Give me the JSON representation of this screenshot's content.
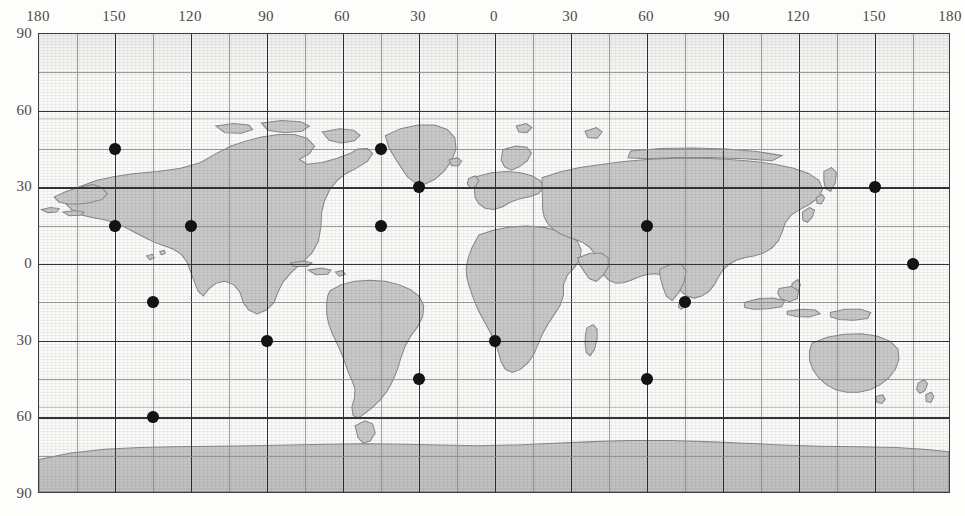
{
  "figure": {
    "kind": "world-map-scatter"
  },
  "axes": {
    "x_label": "",
    "y_label": "",
    "x_ticks": [
      "180",
      "150",
      "120",
      "90",
      "60",
      "30",
      "0",
      "30",
      "60",
      "90",
      "120",
      "150",
      "180"
    ],
    "y_ticks": [
      "90",
      "60",
      "30",
      "0",
      "30",
      "60",
      "90"
    ],
    "x_range": [
      -180,
      180
    ],
    "y_range": [
      -90,
      90
    ],
    "x_tick_step_deg": 30,
    "y_tick_step_deg": 30,
    "grid_step_deg": 15
  },
  "colors": {
    "land": "#c9c9c9",
    "land_stroke": "#8a8a8a",
    "ocean": "#fbfbf9",
    "grid_minor": "#8e8e8e",
    "grid_major": "#343434",
    "frame": "#3d3d3d",
    "marker": "#141414",
    "page": "#fdfdfb",
    "tick_text": "#4a4a4a"
  },
  "chart_data": {
    "type": "scatter",
    "title": "",
    "subtitle": "",
    "xlabel": "Longitude (degrees)",
    "ylabel": "Latitude (degrees)",
    "xlim": [
      -180,
      180
    ],
    "ylim": [
      -90,
      90
    ],
    "grid": true,
    "legend": null,
    "marker_style": {
      "shape": "circle",
      "color": "#141414",
      "size_px": 11
    },
    "point_count": 16,
    "series": [
      {
        "name": "sample sites",
        "points": [
          {
            "lon": -150,
            "lat": 45
          },
          {
            "lon": -120,
            "lat": 15
          },
          {
            "lon": -150,
            "lat": 15
          },
          {
            "lon": -135,
            "lat": -15
          },
          {
            "lon": -135,
            "lat": -60
          },
          {
            "lon": -90,
            "lat": -30
          },
          {
            "lon": -45,
            "lat": 45
          },
          {
            "lon": -45,
            "lat": 15
          },
          {
            "lon": -30,
            "lat": 30
          },
          {
            "lon": -30,
            "lat": -45
          },
          {
            "lon": 0,
            "lat": -30
          },
          {
            "lon": 60,
            "lat": 15
          },
          {
            "lon": 60,
            "lat": -45
          },
          {
            "lon": 75,
            "lat": -15
          },
          {
            "lon": 150,
            "lat": 30
          },
          {
            "lon": 165,
            "lat": 0
          }
        ]
      }
    ]
  }
}
